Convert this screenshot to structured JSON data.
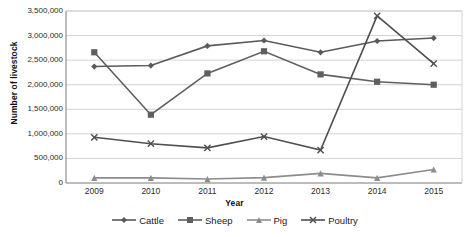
{
  "chart_data": {
    "type": "line",
    "title": "",
    "xlabel": "Year",
    "ylabel": "Number of livestock",
    "categories": [
      "2009",
      "2010",
      "2011",
      "2012",
      "2013",
      "2014",
      "2015"
    ],
    "x": [
      2009,
      2010,
      2011,
      2012,
      2013,
      2014,
      2015
    ],
    "ylim": [
      0,
      3500000
    ],
    "ytick_values": [
      0,
      500000,
      1000000,
      1500000,
      2000000,
      2500000,
      3000000,
      3500000
    ],
    "ytick_labels": [
      "0",
      "500,000",
      "1,000,000",
      "1,500,000",
      "2,000,000",
      "2,500,000",
      "3,000,000",
      "3,500,000"
    ],
    "grid": true,
    "legend_position": "bottom",
    "series": [
      {
        "name": "Cattle",
        "marker": "diamond",
        "color": "#5a5a5a",
        "values": [
          2370000,
          2390000,
          2790000,
          2900000,
          2660000,
          2890000,
          2950000
        ]
      },
      {
        "name": "Sheep",
        "marker": "square",
        "color": "#5f5f5f",
        "values": [
          2660000,
          1390000,
          2230000,
          2680000,
          2210000,
          2060000,
          2000000
        ]
      },
      {
        "name": "Pig",
        "marker": "triangle",
        "color": "#8c8c8c",
        "values": [
          105000,
          105000,
          80000,
          110000,
          195000,
          105000,
          275000
        ]
      },
      {
        "name": "Poultry",
        "marker": "cross",
        "color": "#4f4f4f",
        "values": [
          930000,
          800000,
          715000,
          945000,
          670000,
          3400000,
          2430000
        ]
      }
    ]
  },
  "colors": {
    "plot_border": "#7a7a7a",
    "gridline": "#c8c8c8",
    "background": "#ffffff",
    "text": "#1a1a1a"
  }
}
